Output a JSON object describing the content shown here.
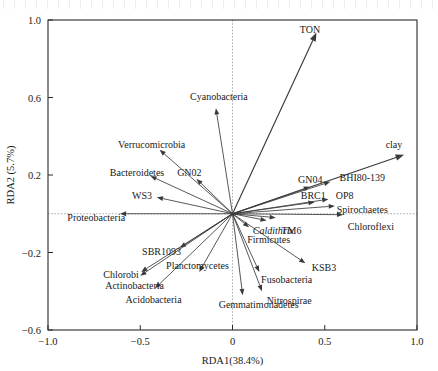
{
  "figure": {
    "type": "rda-biplot",
    "background": "#ffffff",
    "line_color": "#3a3a3a"
  },
  "axes": {
    "x": {
      "title": "RDA1(38.4%)",
      "ticks": [
        "-1.0",
        "-0.5",
        "0",
        "0.5",
        "1.0"
      ],
      "tick_values": [
        -1.0,
        -0.5,
        0,
        0.5,
        1.0
      ],
      "range": [
        -1.0,
        1.0
      ]
    },
    "y": {
      "title": "RDA2 (5.7%)",
      "ticks": [
        "1.0",
        "0.6",
        "0.2",
        "-0.2",
        "-0.6"
      ],
      "tick_values": [
        1.0,
        0.6,
        0.2,
        -0.2,
        -0.6
      ],
      "range": [
        -0.6,
        1.0
      ]
    }
  },
  "chart_data": {
    "type": "scatter",
    "title": "",
    "xlabel": "RDA1(38.4%)",
    "ylabel": "RDA2 (5.7%)",
    "xlim": [
      -1.0,
      1.0
    ],
    "ylim": [
      -0.6,
      1.0
    ],
    "grid": false,
    "legend": "none",
    "origin": [
      0,
      0
    ],
    "environmental_vectors": [
      {
        "name": "TON",
        "x": 0.455,
        "y": 0.935,
        "label": "TON",
        "label_x": 0.365,
        "label_y": 0.95,
        "italic": false
      },
      {
        "name": "clay",
        "x": 0.93,
        "y": 0.305,
        "label": "clay",
        "label_x": 0.83,
        "label_y": 0.36,
        "italic": false
      }
    ],
    "taxa_vectors": [
      {
        "name": "Cyanobacteria",
        "x": -0.09,
        "y": 0.545,
        "label": "Cyanobacteria",
        "label_x": -0.23,
        "label_y": 0.605,
        "italic": false
      },
      {
        "name": "Verrucomicrobia",
        "x": -0.395,
        "y": 0.33,
        "label": "Verrucomicrobia",
        "label_x": -0.62,
        "label_y": 0.355,
        "italic": false
      },
      {
        "name": "Bacteroidetes",
        "x": -0.445,
        "y": 0.195,
        "label": "Bacteroidetes",
        "label_x": -0.665,
        "label_y": 0.215,
        "italic": false
      },
      {
        "name": "GN02",
        "x": -0.195,
        "y": 0.18,
        "label": "GN02",
        "label_x": -0.3,
        "label_y": 0.215,
        "italic": false
      },
      {
        "name": "WS3",
        "x": -0.41,
        "y": 0.085,
        "label": "WS3",
        "label_x": -0.545,
        "label_y": 0.095,
        "italic": false
      },
      {
        "name": "Proteobacteria",
        "x": -0.61,
        "y": 0.0,
        "label": "Proteobacteria",
        "label_x": -0.895,
        "label_y": -0.02,
        "italic": false
      },
      {
        "name": "SBR1093",
        "x": -0.285,
        "y": -0.175,
        "label": "SBR1093",
        "label_x": -0.49,
        "label_y": -0.195,
        "italic": false
      },
      {
        "name": "Chlorobi",
        "x": -0.495,
        "y": -0.3,
        "label": "Chlorobi",
        "label_x": -0.7,
        "label_y": -0.315,
        "italic": false
      },
      {
        "name": "Actinobacteria",
        "x": -0.5,
        "y": -0.32,
        "label": "Actinobacteria",
        "label_x": -0.69,
        "label_y": -0.37,
        "italic": false
      },
      {
        "name": "Acidobacteria",
        "x": -0.42,
        "y": -0.385,
        "label": "Acidobacteria",
        "label_x": -0.58,
        "label_y": -0.44,
        "italic": false
      },
      {
        "name": "Planctomycetes",
        "x": -0.18,
        "y": -0.3,
        "label": "Planctomycetes",
        "label_x": -0.36,
        "label_y": -0.265,
        "italic": false
      },
      {
        "name": "Gemmatimonadetes",
        "x": 0.055,
        "y": -0.42,
        "label": "Gemmatimonadetes",
        "label_x": -0.075,
        "label_y": -0.47,
        "italic": false
      },
      {
        "name": "Nitrospirae",
        "x": 0.16,
        "y": -0.4,
        "label": "Nitrospirae",
        "label_x": 0.185,
        "label_y": -0.45,
        "italic": false
      },
      {
        "name": "Fusobacteria",
        "x": 0.145,
        "y": -0.3,
        "label": "Fusobacteria",
        "label_x": 0.155,
        "label_y": -0.34,
        "italic": false
      },
      {
        "name": "KSB3",
        "x": 0.395,
        "y": -0.255,
        "label": "KSB3",
        "label_x": 0.43,
        "label_y": -0.275,
        "italic": false
      },
      {
        "name": "Firmicutes",
        "x": 0.09,
        "y": -0.07,
        "label": "Firmicutes",
        "label_x": 0.08,
        "label_y": -0.135,
        "italic": false
      },
      {
        "name": "Caldithrix",
        "x": 0.185,
        "y": -0.035,
        "label": "Caldithrix",
        "label_x": 0.11,
        "label_y": -0.085,
        "italic": true
      },
      {
        "name": "TM6",
        "x": 0.235,
        "y": -0.02,
        "label": "TM6",
        "label_x": 0.265,
        "label_y": -0.085,
        "italic": false
      },
      {
        "name": "Chloroflexi",
        "x": 0.6,
        "y": -0.005,
        "label": "Chloroflexi",
        "label_x": 0.625,
        "label_y": -0.065,
        "italic": false
      },
      {
        "name": "Spirochaetes",
        "x": 0.555,
        "y": 0.04,
        "label": "Spirochaetes",
        "label_x": 0.565,
        "label_y": 0.02,
        "italic": false
      },
      {
        "name": "BRC1",
        "x": 0.445,
        "y": 0.06,
        "label": "BRC1",
        "label_x": 0.37,
        "label_y": 0.095,
        "italic": false
      },
      {
        "name": "OP8",
        "x": 0.52,
        "y": 0.075,
        "label": "OP8",
        "label_x": 0.56,
        "label_y": 0.095,
        "italic": false
      },
      {
        "name": "GN04",
        "x": 0.42,
        "y": 0.14,
        "label": "GN04",
        "label_x": 0.355,
        "label_y": 0.175,
        "italic": false
      },
      {
        "name": "BHI80-139",
        "x": 0.53,
        "y": 0.165,
        "label": "BHI80-139",
        "label_x": 0.58,
        "label_y": 0.185,
        "italic": false
      }
    ]
  }
}
